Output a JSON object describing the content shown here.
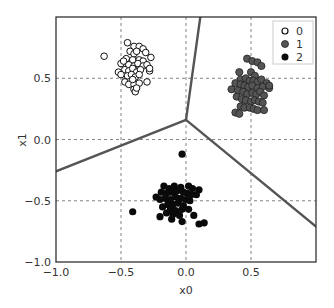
{
  "chart_data": {
    "type": "scatter",
    "title": "",
    "xlabel": "x0",
    "ylabel": "x1",
    "xlim": [
      -1.0,
      1.0
    ],
    "ylim": [
      -1.0,
      1.0
    ],
    "xticks": [
      "−1.0",
      "−0.5",
      "0.0",
      "0.5"
    ],
    "xtick_values": [
      -1.0,
      -0.5,
      0.0,
      0.5
    ],
    "yticks": [
      "−1.0",
      "−0.5",
      "0.0",
      "0.5"
    ],
    "ytick_values": [
      -1.0,
      -0.5,
      0.0,
      0.5
    ],
    "grid": true,
    "legend_position": "upper right",
    "legend": [
      "0",
      "1",
      "2"
    ],
    "colors": {
      "class0_fill": "#ffffff",
      "class0_edge": "#111111",
      "class1": "#555555",
      "class2": "#0a0a0a",
      "boundary": "#555555",
      "grid": "#666666"
    },
    "decision_boundary": {
      "junction": [
        0.0,
        0.16
      ],
      "segments": [
        [
          [
            0.0,
            0.16
          ],
          [
            0.11,
            1.0
          ]
        ],
        [
          [
            0.0,
            0.16
          ],
          [
            -1.0,
            -0.26
          ]
        ],
        [
          [
            0.0,
            0.16
          ],
          [
            1.0,
            -0.71
          ]
        ]
      ]
    },
    "series": [
      {
        "name": "0",
        "marker": "open-circle",
        "points": [
          [
            -0.63,
            0.68
          ],
          [
            -0.45,
            0.79
          ],
          [
            -0.4,
            0.76
          ],
          [
            -0.36,
            0.76
          ],
          [
            -0.33,
            0.74
          ],
          [
            -0.31,
            0.71
          ],
          [
            -0.27,
            0.67
          ],
          [
            -0.43,
            0.72
          ],
          [
            -0.4,
            0.7
          ],
          [
            -0.38,
            0.72
          ],
          [
            -0.46,
            0.66
          ],
          [
            -0.41,
            0.65
          ],
          [
            -0.36,
            0.65
          ],
          [
            -0.33,
            0.64
          ],
          [
            -0.5,
            0.62
          ],
          [
            -0.48,
            0.64
          ],
          [
            -0.44,
            0.61
          ],
          [
            -0.4,
            0.6
          ],
          [
            -0.37,
            0.62
          ],
          [
            -0.33,
            0.6
          ],
          [
            -0.3,
            0.61
          ],
          [
            -0.52,
            0.55
          ],
          [
            -0.47,
            0.57
          ],
          [
            -0.44,
            0.56
          ],
          [
            -0.41,
            0.58
          ],
          [
            -0.38,
            0.55
          ],
          [
            -0.35,
            0.57
          ],
          [
            -0.28,
            0.56
          ],
          [
            -0.28,
            0.58
          ],
          [
            -0.5,
            0.53
          ],
          [
            -0.45,
            0.52
          ],
          [
            -0.42,
            0.53
          ],
          [
            -0.39,
            0.51
          ],
          [
            -0.36,
            0.53
          ],
          [
            -0.47,
            0.47
          ],
          [
            -0.44,
            0.45
          ],
          [
            -0.4,
            0.45
          ],
          [
            -0.36,
            0.46
          ],
          [
            -0.3,
            0.47
          ],
          [
            -0.41,
            0.49
          ],
          [
            -0.4,
            0.41
          ],
          [
            -0.39,
            0.39
          ],
          [
            -0.38,
            0.42
          ]
        ]
      },
      {
        "name": "1",
        "marker": "filled-circle-gray",
        "points": [
          [
            0.47,
            0.66
          ],
          [
            0.51,
            0.64
          ],
          [
            0.55,
            0.63
          ],
          [
            0.58,
            0.6
          ],
          [
            0.41,
            0.55
          ],
          [
            0.5,
            0.55
          ],
          [
            0.53,
            0.52
          ],
          [
            0.42,
            0.49
          ],
          [
            0.46,
            0.5
          ],
          [
            0.49,
            0.48
          ],
          [
            0.52,
            0.48
          ],
          [
            0.55,
            0.47
          ],
          [
            0.58,
            0.49
          ],
          [
            0.62,
            0.46
          ],
          [
            0.38,
            0.46
          ],
          [
            0.42,
            0.45
          ],
          [
            0.45,
            0.44
          ],
          [
            0.48,
            0.43
          ],
          [
            0.51,
            0.44
          ],
          [
            0.55,
            0.42
          ],
          [
            0.59,
            0.43
          ],
          [
            0.64,
            0.42
          ],
          [
            0.64,
            0.44
          ],
          [
            0.35,
            0.41
          ],
          [
            0.4,
            0.4
          ],
          [
            0.44,
            0.39
          ],
          [
            0.47,
            0.37
          ],
          [
            0.51,
            0.38
          ],
          [
            0.54,
            0.37
          ],
          [
            0.57,
            0.39
          ],
          [
            0.6,
            0.36
          ],
          [
            0.39,
            0.35
          ],
          [
            0.43,
            0.33
          ],
          [
            0.46,
            0.32
          ],
          [
            0.5,
            0.31
          ],
          [
            0.53,
            0.32
          ],
          [
            0.56,
            0.31
          ],
          [
            0.59,
            0.3
          ],
          [
            0.42,
            0.27
          ],
          [
            0.45,
            0.26
          ],
          [
            0.49,
            0.26
          ],
          [
            0.52,
            0.25
          ],
          [
            0.55,
            0.24
          ],
          [
            0.6,
            0.24
          ],
          [
            0.38,
            0.22
          ],
          [
            0.41,
            0.21
          ]
        ]
      },
      {
        "name": "2",
        "marker": "filled-circle-black",
        "points": [
          [
            -0.03,
            -0.12
          ],
          [
            -0.23,
            -0.47
          ],
          [
            -0.41,
            -0.59
          ],
          [
            -0.17,
            -0.38
          ],
          [
            -0.13,
            -0.4
          ],
          [
            -0.09,
            -0.38
          ],
          [
            -0.04,
            -0.39
          ],
          [
            0.02,
            -0.38
          ],
          [
            0.05,
            -0.4
          ],
          [
            0.1,
            -0.41
          ],
          [
            -0.19,
            -0.43
          ],
          [
            -0.15,
            -0.44
          ],
          [
            -0.11,
            -0.43
          ],
          [
            -0.07,
            -0.42
          ],
          [
            -0.02,
            -0.43
          ],
          [
            0.01,
            -0.44
          ],
          [
            0.04,
            -0.45
          ],
          [
            0.08,
            -0.45
          ],
          [
            -0.2,
            -0.49
          ],
          [
            -0.16,
            -0.48
          ],
          [
            -0.12,
            -0.49
          ],
          [
            -0.08,
            -0.47
          ],
          [
            -0.04,
            -0.48
          ],
          [
            0.0,
            -0.49
          ],
          [
            0.03,
            -0.5
          ],
          [
            -0.14,
            -0.53
          ],
          [
            -0.1,
            -0.53
          ],
          [
            -0.06,
            -0.52
          ],
          [
            -0.02,
            -0.54
          ],
          [
            -0.18,
            -0.55
          ],
          [
            -0.12,
            -0.57
          ],
          [
            -0.08,
            -0.58
          ],
          [
            -0.03,
            -0.57
          ],
          [
            0.02,
            -0.57
          ],
          [
            -0.15,
            -0.6
          ],
          [
            -0.1,
            -0.61
          ],
          [
            -0.05,
            -0.62
          ],
          [
            0.06,
            -0.62
          ],
          [
            -0.2,
            -0.63
          ],
          [
            -0.11,
            -0.65
          ],
          [
            -0.03,
            -0.67
          ],
          [
            0.1,
            -0.69
          ],
          [
            0.14,
            -0.68
          ]
        ]
      }
    ]
  }
}
